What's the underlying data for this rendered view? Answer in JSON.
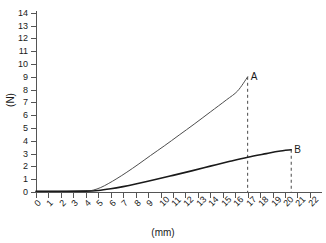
{
  "chart_data": {
    "type": "line",
    "title": "",
    "xlabel": "(mm)",
    "ylabel": "(N)",
    "xlim": [
      0,
      22
    ],
    "ylim": [
      0,
      14
    ],
    "grid": false,
    "legend": "none",
    "xticks": [
      "0",
      "1",
      "2",
      "3",
      "4",
      "5",
      "6",
      "7",
      "8",
      "9",
      "10",
      "11",
      "12",
      "13",
      "14",
      "15",
      "16",
      "17",
      "18",
      "19",
      "20",
      "21",
      "22"
    ],
    "yticks": [
      "0",
      "1",
      "2",
      "3",
      "4",
      "5",
      "6",
      "7",
      "8",
      "9",
      "10",
      "11",
      "12",
      "13",
      "14"
    ],
    "annotations": [
      {
        "label": "A",
        "x": 17.0,
        "y": 9.0,
        "guide": "dashed-vertical"
      },
      {
        "label": "B",
        "x": 20.5,
        "y": 3.3,
        "guide": "dashed-vertical"
      }
    ],
    "series": [
      {
        "name": "A",
        "color": "#4d4d4d",
        "width": 1.0,
        "points": [
          {
            "x": 0.0,
            "y": 0.05
          },
          {
            "x": 2.0,
            "y": 0.05
          },
          {
            "x": 4.0,
            "y": 0.08
          },
          {
            "x": 4.6,
            "y": 0.15
          },
          {
            "x": 5.2,
            "y": 0.35
          },
          {
            "x": 5.8,
            "y": 0.65
          },
          {
            "x": 6.5,
            "y": 1.05
          },
          {
            "x": 7.3,
            "y": 1.55
          },
          {
            "x": 8.2,
            "y": 2.15
          },
          {
            "x": 9.2,
            "y": 2.85
          },
          {
            "x": 10.3,
            "y": 3.6
          },
          {
            "x": 11.5,
            "y": 4.45
          },
          {
            "x": 12.7,
            "y": 5.3
          },
          {
            "x": 14.0,
            "y": 6.25
          },
          {
            "x": 15.3,
            "y": 7.2
          },
          {
            "x": 16.2,
            "y": 7.9
          },
          {
            "x": 17.0,
            "y": 9.0
          }
        ]
      },
      {
        "name": "B",
        "color": "#1a1a1a",
        "width": 1.6,
        "points": [
          {
            "x": 0.0,
            "y": 0.06
          },
          {
            "x": 2.0,
            "y": 0.06
          },
          {
            "x": 4.0,
            "y": 0.07
          },
          {
            "x": 5.0,
            "y": 0.12
          },
          {
            "x": 6.0,
            "y": 0.25
          },
          {
            "x": 7.0,
            "y": 0.42
          },
          {
            "x": 8.0,
            "y": 0.62
          },
          {
            "x": 9.5,
            "y": 0.95
          },
          {
            "x": 11.0,
            "y": 1.3
          },
          {
            "x": 12.5,
            "y": 1.65
          },
          {
            "x": 14.0,
            "y": 2.02
          },
          {
            "x": 15.5,
            "y": 2.38
          },
          {
            "x": 17.0,
            "y": 2.72
          },
          {
            "x": 18.5,
            "y": 3.0
          },
          {
            "x": 19.5,
            "y": 3.18
          },
          {
            "x": 20.5,
            "y": 3.3
          }
        ]
      }
    ]
  }
}
